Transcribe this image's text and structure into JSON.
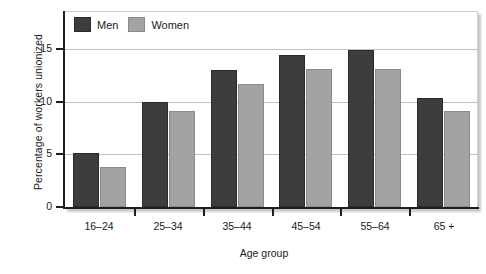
{
  "chart_data": {
    "type": "bar",
    "title": "",
    "xlabel": "Age group",
    "ylabel": "Percentage of workers unionized",
    "categories": [
      "16–24",
      "25–34",
      "35–44",
      "45–54",
      "55–64",
      "65 +"
    ],
    "series": [
      {
        "name": "Men",
        "color": "#3d3d3d",
        "values": [
          5.1,
          10.0,
          13.0,
          14.4,
          14.9,
          10.3
        ]
      },
      {
        "name": "Women",
        "color": "#a3a3a3",
        "values": [
          3.8,
          9.1,
          11.7,
          13.1,
          13.1,
          9.1
        ]
      }
    ],
    "ylim": [
      0,
      18.5
    ],
    "yticks": [
      0,
      5,
      10,
      15
    ],
    "ytick_labels": [
      "0",
      "5",
      "10",
      "15"
    ],
    "grid": "horizontal",
    "legend_position": "top-left-inside",
    "legend": [
      {
        "label": "Men",
        "swatch": "men"
      },
      {
        "label": "Women",
        "swatch": "women"
      }
    ]
  }
}
